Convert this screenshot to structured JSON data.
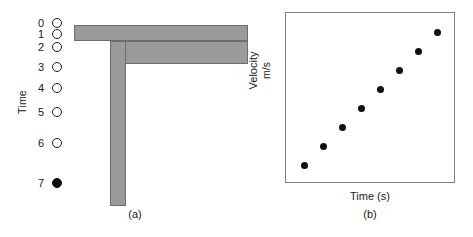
{
  "figure": {
    "panel_a": {
      "caption": "(a)",
      "axis_label": "Time",
      "tick_labels": [
        "0",
        "1",
        "2",
        "3",
        "4",
        "5",
        "6",
        "7"
      ],
      "markers": [
        {
          "label": "0",
          "style": "open"
        },
        {
          "label": "1",
          "style": "open"
        },
        {
          "label": "2",
          "style": "open"
        },
        {
          "label": "3",
          "style": "open"
        },
        {
          "label": "4",
          "style": "open"
        },
        {
          "label": "5",
          "style": "open"
        },
        {
          "label": "6",
          "style": "open"
        },
        {
          "label": "7",
          "style": "filled"
        }
      ],
      "marker_y": [
        16,
        27,
        40,
        60,
        81,
        105,
        136,
        176
      ],
      "shape_color": "#9a9a9a",
      "shape_outline_color": "#6e6e6e",
      "marker_color": "#0d0d0d"
    },
    "panel_b": {
      "caption": "(b)"
    }
  },
  "chart_data": {
    "type": "scatter",
    "title": "",
    "xlabel": "Time (s)",
    "ylabel": "Velocity m/s",
    "ylabel_line1": "Velocity",
    "ylabel_line2": "m/s",
    "grid": false,
    "legend": "none",
    "xlim": [
      0,
      9
    ],
    "ylim": [
      0,
      9
    ],
    "x": [
      1,
      2,
      3,
      4,
      5,
      6,
      7,
      8
    ],
    "y": [
      1,
      2,
      3,
      4,
      5,
      6,
      7,
      8
    ],
    "point_color": "#111111",
    "axis_color": "#808080",
    "series": [
      {
        "name": "velocity vs time",
        "points": [
          {
            "x": 1,
            "y": 1
          },
          {
            "x": 2,
            "y": 2
          },
          {
            "x": 3,
            "y": 3
          },
          {
            "x": 4,
            "y": 4
          },
          {
            "x": 5,
            "y": 5
          },
          {
            "x": 6,
            "y": 6
          },
          {
            "x": 7,
            "y": 7
          },
          {
            "x": 8,
            "y": 8
          }
        ]
      }
    ]
  }
}
